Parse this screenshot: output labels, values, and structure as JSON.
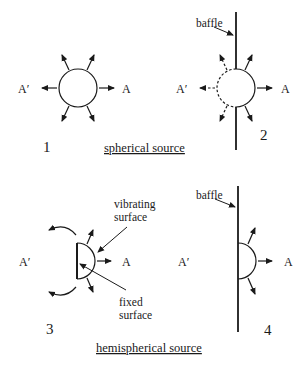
{
  "figure": {
    "panel_1": {
      "number": "1",
      "left_label": "A′",
      "right_label": "A"
    },
    "panel_2": {
      "number": "2",
      "left_label": "A′",
      "right_label": "A",
      "baffle_label": "baffle"
    },
    "panel_3": {
      "number": "3",
      "left_label": "A′",
      "right_label": "A",
      "vibrating_label_1": "vibrating",
      "vibrating_label_2": "surface",
      "fixed_label_1": "fixed",
      "fixed_label_2": "surface"
    },
    "panel_4": {
      "number": "4",
      "left_label": "A′",
      "right_label": "A",
      "baffle_label": "baffle"
    },
    "captions": {
      "top": "spherical source",
      "bottom": "hemispherical source"
    }
  },
  "colors": {
    "ink": "#1a1a1a",
    "background": "#ffffff"
  }
}
